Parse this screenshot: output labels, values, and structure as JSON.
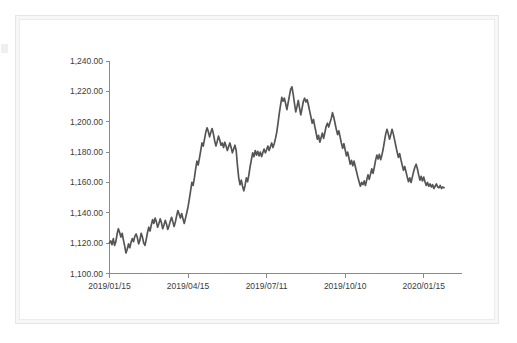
{
  "card": {
    "background": "#ffffff",
    "border_color": "#ececed"
  },
  "artifact": {
    "name": "cropped-edge-mark"
  },
  "chart_data": {
    "type": "line",
    "title": "",
    "subtitle": "",
    "xlabel": "",
    "ylabel": "",
    "grid": false,
    "legend": false,
    "line_color": "#555555",
    "ylim": [
      1100,
      1240
    ],
    "ytick_labels": [
      "1,240.00",
      "1,220.00",
      "1,200.00",
      "1,180.00",
      "1,160.00",
      "1,140.00",
      "1,120.00",
      "1,100.00"
    ],
    "ytick_values": [
      1240,
      1220,
      1200,
      1180,
      1160,
      1140,
      1120,
      1100
    ],
    "xtick_labels": [
      "2019/01/15",
      "2019/04/15",
      "2019/07/11",
      "2019/10/10",
      "2020/01/15"
    ],
    "xtick_indices": [
      0,
      62,
      124,
      186,
      248
    ],
    "xlim": [
      0,
      265
    ],
    "series": [
      {
        "name": "price",
        "values": [
          1120.0,
          1121.5,
          1119.0,
          1123.0,
          1118.5,
          1121.0,
          1126.0,
          1129.5,
          1127.0,
          1124.0,
          1126.5,
          1122.0,
          1118.0,
          1113.5,
          1116.0,
          1119.5,
          1117.0,
          1120.5,
          1123.0,
          1121.0,
          1124.5,
          1126.0,
          1123.5,
          1119.5,
          1122.0,
          1126.5,
          1124.0,
          1120.0,
          1118.5,
          1122.5,
          1127.0,
          1130.5,
          1128.0,
          1132.0,
          1135.5,
          1133.0,
          1136.5,
          1134.0,
          1130.5,
          1133.0,
          1136.0,
          1133.5,
          1129.5,
          1132.0,
          1135.0,
          1132.5,
          1129.0,
          1131.5,
          1134.5,
          1137.0,
          1134.0,
          1131.0,
          1134.0,
          1138.0,
          1141.5,
          1139.0,
          1136.5,
          1139.5,
          1136.0,
          1133.0,
          1136.5,
          1140.0,
          1144.0,
          1149.0,
          1154.5,
          1160.0,
          1158.0,
          1163.0,
          1169.0,
          1174.0,
          1171.5,
          1176.0,
          1181.0,
          1186.0,
          1184.0,
          1188.5,
          1193.0,
          1196.0,
          1193.5,
          1190.0,
          1193.0,
          1195.5,
          1192.0,
          1187.5,
          1184.0,
          1187.0,
          1190.5,
          1188.0,
          1184.5,
          1186.0,
          1183.0,
          1186.5,
          1184.0,
          1181.0,
          1183.5,
          1186.0,
          1183.0,
          1179.5,
          1182.0,
          1184.5,
          1181.0,
          1171.0,
          1163.0,
          1158.5,
          1161.5,
          1157.5,
          1154.5,
          1158.0,
          1163.0,
          1160.5,
          1165.0,
          1170.5,
          1175.0,
          1179.5,
          1177.0,
          1181.0,
          1178.0,
          1180.5,
          1177.5,
          1180.0,
          1177.0,
          1179.5,
          1182.0,
          1179.5,
          1181.5,
          1184.0,
          1181.0,
          1183.5,
          1186.0,
          1183.0,
          1185.5,
          1189.0,
          1193.0,
          1199.0,
          1205.5,
          1211.0,
          1216.0,
          1213.5,
          1215.5,
          1212.0,
          1208.0,
          1212.5,
          1217.0,
          1221.5,
          1223.0,
          1218.0,
          1212.0,
          1206.5,
          1210.0,
          1214.0,
          1209.0,
          1204.5,
          1209.0,
          1213.5,
          1215.5,
          1213.0,
          1214.5,
          1211.0,
          1207.0,
          1203.0,
          1199.0,
          1201.5,
          1197.0,
          1193.0,
          1188.5,
          1191.0,
          1186.5,
          1189.5,
          1192.5,
          1189.0,
          1193.0,
          1197.0,
          1199.0,
          1196.5,
          1199.5,
          1202.0,
          1206.0,
          1203.0,
          1199.0,
          1195.0,
          1191.5,
          1194.0,
          1190.0,
          1186.0,
          1182.5,
          1185.5,
          1181.5,
          1177.5,
          1180.0,
          1176.0,
          1172.0,
          1174.5,
          1171.0,
          1174.0,
          1170.5,
          1167.0,
          1163.5,
          1160.5,
          1157.5,
          1160.0,
          1158.5,
          1161.0,
          1158.0,
          1161.5,
          1165.0,
          1162.0,
          1165.5,
          1169.0,
          1166.0,
          1170.0,
          1174.5,
          1178.0,
          1175.5,
          1178.5,
          1175.0,
          1178.0,
          1182.0,
          1187.0,
          1192.0,
          1195.0,
          1192.0,
          1188.5,
          1191.5,
          1195.0,
          1192.0,
          1188.0,
          1184.0,
          1180.0,
          1176.5,
          1179.0,
          1175.0,
          1171.5,
          1168.0,
          1170.5,
          1167.0,
          1163.5,
          1160.5,
          1163.0,
          1160.0,
          1163.5,
          1167.0,
          1170.0,
          1172.0,
          1169.0,
          1165.0,
          1161.5,
          1164.0,
          1161.0,
          1163.5,
          1160.5,
          1158.0,
          1160.0,
          1157.5,
          1159.0,
          1157.0,
          1158.5,
          1156.0,
          1157.5,
          1159.0,
          1157.0,
          1156.5,
          1158.0,
          1156.0,
          1157.0,
          1156.5
        ]
      }
    ]
  }
}
